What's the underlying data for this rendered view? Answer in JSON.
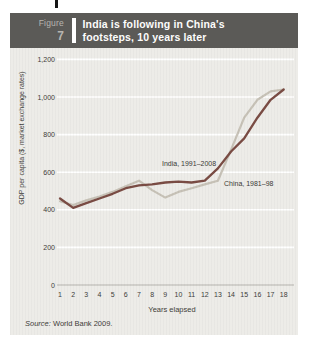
{
  "header": {
    "figure_label": "Figure",
    "figure_number": "7",
    "title_line1": "India is following in China's",
    "title_line2": "footsteps, 10 years later"
  },
  "chart_data": {
    "type": "line",
    "title": "India is following in China's footsteps, 10 years later",
    "xlabel": "Years elapsed",
    "ylabel": "GDP per capita ($, market exchange rates)",
    "x": [
      1,
      2,
      3,
      4,
      5,
      6,
      7,
      8,
      9,
      10,
      11,
      12,
      13,
      14,
      15,
      16,
      17,
      18
    ],
    "ylim": [
      0,
      1200
    ],
    "y_ticks": [
      {
        "value": 0,
        "label": "0"
      },
      {
        "value": 200,
        "label": "200"
      },
      {
        "value": 400,
        "label": "400"
      },
      {
        "value": 600,
        "label": "600"
      },
      {
        "value": 800,
        "label": "800"
      },
      {
        "value": 1000,
        "label": "1,000"
      },
      {
        "value": 1200,
        "label": "1,200"
      }
    ],
    "grid": "horizontal-white-gridlines",
    "legend_position": "inline-labels-on-plot",
    "series": [
      {
        "name": "India, 1991–2008",
        "color": "#7a4c44",
        "values": [
          460,
          410,
          435,
          460,
          485,
          515,
          530,
          535,
          545,
          550,
          545,
          555,
          620,
          710,
          780,
          890,
          985,
          1040
        ]
      },
      {
        "name": "China, 1981–98",
        "color": "#c7c2b7",
        "values": [
          445,
          425,
          450,
          470,
          495,
          525,
          555,
          505,
          465,
          495,
          515,
          535,
          555,
          720,
          890,
          985,
          1030,
          1040
        ]
      }
    ]
  },
  "source": {
    "prefix": "Source:",
    "text": "World Bank 2009."
  },
  "colors": {
    "header_bg": "#5b5a57",
    "header_text": "#ffffff",
    "figure_label_text": "#b7b5b0",
    "body_bg": "#edece8",
    "gridline": "#ffffff",
    "baseline": "#b5b3ae",
    "axis_text": "#3e3d3a",
    "india_line": "#7a4c44",
    "china_line": "#c7c2b7"
  }
}
